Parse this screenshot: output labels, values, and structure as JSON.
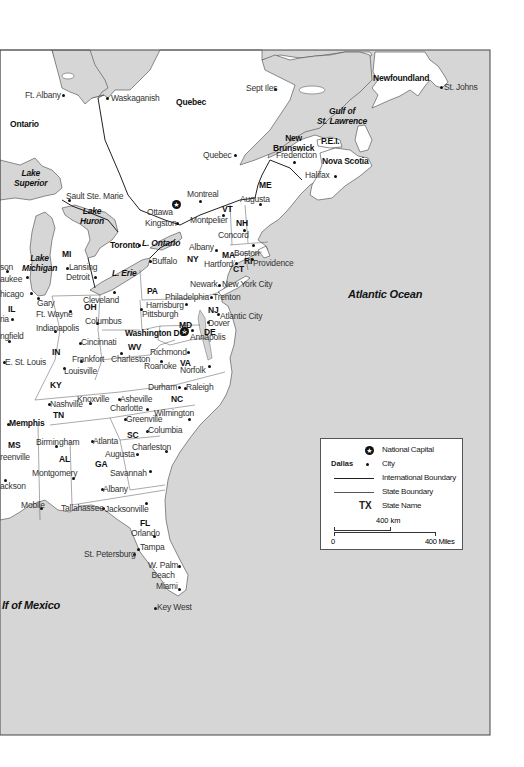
{
  "map": {
    "title": "",
    "regions": {
      "ontario": "Ontario",
      "quebec": "Quebec",
      "newfoundland": "Newfoundland",
      "new_brunswick": "New\nBrunswick",
      "pei": "P.E.I.",
      "nova_scotia": "Nova Scotia"
    },
    "water": {
      "lake_superior": "Lake\nSuperior",
      "lake_huron": "Lake\nHuron",
      "lake_michigan": "Lake\nMichigan",
      "lake_ontario": "L. Ontario",
      "lake_erie": "L. Erie",
      "gulf_st_lawrence": "Gulf of\nSt. Lawrence",
      "atlantic_ocean": "Atlantic Ocean",
      "gulf_of_mexico": "lf of Mexico"
    },
    "states": [
      "ME",
      "VT",
      "NH",
      "MA",
      "RI",
      "CT",
      "NY",
      "PA",
      "NJ",
      "MD",
      "DE",
      "VA",
      "WV",
      "OH",
      "MI",
      "IN",
      "IL",
      "KY",
      "TN",
      "NC",
      "SC",
      "GA",
      "AL",
      "MS",
      "FL"
    ],
    "cities": {
      "ft_albany": "Ft. Albany",
      "waskaganish": "Waskaganish",
      "sept_iles": "Sept Iles",
      "st_johns": "St. Johns",
      "quebec_city": "Quebec",
      "fredericton": "Fredericton",
      "halifax": "Halifax",
      "augusta_me": "Augusta",
      "montreal": "Montreal",
      "ottawa": "Ottawa",
      "kingston": "Kingston",
      "montpelier": "Montpelier",
      "concord": "Concord",
      "sault_ste_marie": "Sault Ste. Marie",
      "toronto": "Toronto",
      "albany": "Albany",
      "boston": "Boston",
      "hartford": "Hartford",
      "providence": "Providence",
      "buffalo": "Buffalo",
      "lansing": "Lansing",
      "detroit": "Detroit",
      "milwaukee": "aukee",
      "madison": "son",
      "newark": "Newark",
      "new_york_city": "New York City",
      "chicago": "hicago",
      "gary": "Gary",
      "cleveland": "Cleveland",
      "philadelphia": "Philadelphia",
      "trenton": "Trenton",
      "harrisburg": "Harrisburg",
      "pittsburgh": "Pittsburgh",
      "atlantic_city": "Atlantic City",
      "peoria": "ria",
      "ft_wayne": "Ft. Wayne",
      "columbus": "Columbus",
      "washington_dc": "Washington DC",
      "dover": "Dover",
      "annapolis": "Annapolis",
      "springfield": "ngfield",
      "indianapolis": "Indianapolis",
      "cincinnati": "Cincinnati",
      "richmond": "Richmond",
      "e_st_louis": "E. St. Louis",
      "frankfort": "Frankfort",
      "charleston_wv": "Charleston",
      "roanoke": "Roanoke",
      "norfolk": "Norfolk",
      "louisville": "Louisville",
      "durham": "Durham",
      "raleigh": "Raleigh",
      "nashville": "Nashville",
      "knoxville": "Knoxville",
      "asheville": "Asheville",
      "charlotte": "Charlotte",
      "wilmington": "Wilmington",
      "memphis": "Memphis",
      "greenville_sc": "Greenville",
      "columbia": "Columbia",
      "birmingham": "Birmingham",
      "atlanta": "Atlanta",
      "charleston_sc": "Charleston",
      "greenville_ms": "reenville",
      "augusta_ga": "Augusta",
      "montgomery": "Montgomery",
      "savannah": "Savannah",
      "jackson": "ackson",
      "albany_ga": "Albany",
      "mobile": "Mobile",
      "tallahassee": "Tallahassee",
      "jacksonville": "Jacksonville",
      "orlando": "Orlando",
      "tampa": "Tampa",
      "st_petersburg": "St. Petersburg",
      "w_palm_beach": "W. Palm\nBeach",
      "miami": "Miami",
      "key_west": "Key West"
    }
  },
  "legend": {
    "capital_label": "National Capital",
    "city_example": "Dallas",
    "city_label": "City",
    "intl_boundary_label": "International Boundary",
    "state_boundary_label": "State Boundary",
    "state_name_example": "TX",
    "state_name_label": "State Name",
    "scale_km": "400 km",
    "scale_zero": "0",
    "scale_miles": "400 Miles"
  },
  "colors": {
    "water": "#d6d6d6",
    "land": "#ffffff",
    "boundary": "#333333",
    "text": "#111111"
  }
}
